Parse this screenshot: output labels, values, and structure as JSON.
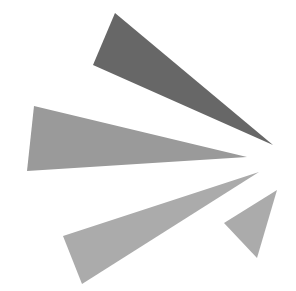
{
  "graphic": {
    "name": "burst-triangles-logo",
    "background": "#ffffff",
    "shapes": [
      {
        "name": "dark-triangle",
        "points": "115,13 93,65 273,145",
        "fill": "#676767"
      },
      {
        "name": "medium-triangle",
        "points": "34,106 27,171 247,157",
        "fill": "#9a9a9a"
      },
      {
        "name": "light-triangle",
        "points": "63,236 82,284 259,172",
        "fill": "#ababab"
      },
      {
        "name": "small-triangle",
        "points": "224,223 257,258 277,190",
        "fill": "#ababab"
      }
    ]
  }
}
